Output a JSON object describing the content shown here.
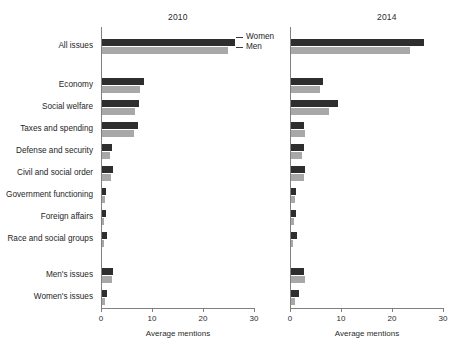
{
  "chart_data": {
    "type": "bar",
    "orientation": "horizontal",
    "title": "",
    "xlabel": "Average mentions",
    "ylabel": "",
    "xlim": [
      0,
      30
    ],
    "xticks": [
      0,
      10,
      20,
      30
    ],
    "xtick_labels": [
      "0",
      "10",
      "20",
      "30"
    ],
    "grid": false,
    "legend": {
      "position": "upper-center-between-panels",
      "entries": [
        {
          "name": "Women",
          "color": "#2e2e2e"
        },
        {
          "name": "Men",
          "color": "#a8a8a8"
        }
      ]
    },
    "panels": [
      {
        "title": "2010",
        "categories": [
          "All issues",
          "Economy",
          "Social welfare",
          "Taxes and spending",
          "Defense and security",
          "Civil and social order",
          "Government functioning",
          "Foreign affairs",
          "Race and social groups",
          "Men's issues",
          "Women's issues"
        ],
        "series": [
          {
            "name": "Women",
            "values": [
              26.0,
              8.2,
              7.3,
              7.1,
              2.0,
              2.2,
              0.8,
              0.8,
              0.9,
              2.2,
              1.0
            ]
          },
          {
            "name": "Men",
            "values": [
              24.7,
              7.5,
              6.5,
              6.3,
              1.6,
              1.7,
              0.5,
              0.4,
              0.4,
              2.0,
              0.6
            ]
          }
        ]
      },
      {
        "title": "2014",
        "categories": [
          "All issues",
          "Economy",
          "Social welfare",
          "Taxes and spending",
          "Defense and security",
          "Civil and social order",
          "Government functioning",
          "Foreign affairs",
          "Race and social groups",
          "Men's issues",
          "Women's issues"
        ],
        "series": [
          {
            "name": "Women",
            "values": [
              26.1,
              6.3,
              9.2,
              2.5,
              2.5,
              2.7,
              0.9,
              0.9,
              1.2,
              2.5,
              1.5
            ]
          },
          {
            "name": "Men",
            "values": [
              23.3,
              5.7,
              7.5,
              2.7,
              2.2,
              2.6,
              0.7,
              0.5,
              0.4,
              2.7,
              0.8
            ]
          }
        ]
      }
    ]
  },
  "categories": [
    {
      "label": "All issues"
    },
    {
      "label": "Economy"
    },
    {
      "label": "Social welfare"
    },
    {
      "label": "Taxes and spending"
    },
    {
      "label": "Defense and security"
    },
    {
      "label": "Civil and social order"
    },
    {
      "label": "Government functioning"
    },
    {
      "label": "Foreign affairs"
    },
    {
      "label": "Race and social groups"
    },
    {
      "label": "Men's issues"
    },
    {
      "label": "Women's issues"
    }
  ],
  "panel_left": {
    "title": "2010",
    "axis_title": "Average mentions"
  },
  "panel_right": {
    "title": "2014",
    "axis_title": "Average mentions"
  },
  "legend": {
    "women": "Women",
    "men": "Men"
  },
  "colors": {
    "women": "#2e2e2e",
    "men": "#a8a8a8",
    "axis": "#808080"
  }
}
